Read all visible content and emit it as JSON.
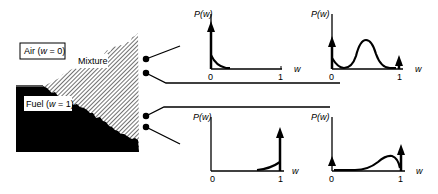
{
  "regions": {
    "air": {
      "label": "Air (",
      "var": "w",
      "eq": " = 0)"
    },
    "mixture": {
      "label": "Mixture"
    },
    "fuel": {
      "label": "Fuel (",
      "var": "w",
      "eq": " = 1)"
    }
  },
  "pdfs": [
    {
      "id": "air-side",
      "ylabel": "P(w)",
      "xlabel": "w",
      "tick0": "0",
      "tick1": "1",
      "description": "delta peak at w=0 with decaying tail"
    },
    {
      "id": "mixing-layer",
      "ylabel": "P(w)",
      "xlabel": "w",
      "tick0": "0",
      "tick1": "1",
      "description": "delta peaks at 0 and 1 with central bump"
    },
    {
      "id": "fuel-side",
      "ylabel": "P(w)",
      "xlabel": "w",
      "tick0": "0",
      "tick1": "1",
      "description": "delta peak at w=1 with rising tail"
    },
    {
      "id": "fuel-mixing",
      "ylabel": "P(w)",
      "xlabel": "w",
      "tick0": "0",
      "tick1": "1",
      "description": "small delta at 0, large delta at 1, skewed bump near 1"
    }
  ],
  "colors": {
    "ink": "#000000",
    "hatch": "#9a9a9a",
    "background": "#ffffff"
  }
}
